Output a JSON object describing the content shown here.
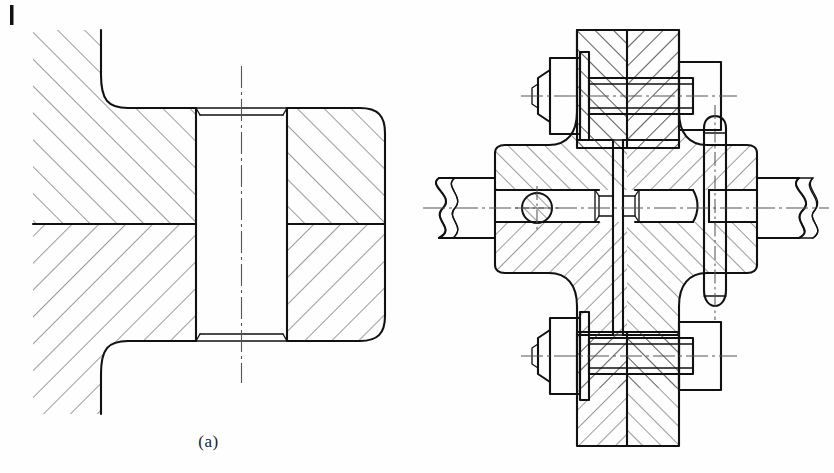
{
  "page": {
    "kind": "engineering-drawing",
    "background_color": "#fefefe",
    "line_color": "#111111",
    "hatch_color": "#3a3a3a",
    "centerline_color": "#555555",
    "width": 834,
    "height": 473,
    "corner_tick": "page-edge-tick"
  },
  "figures": [
    {
      "id": "a",
      "caption": "(a)",
      "title": "Dowel pin in sectioned housing",
      "description": "Sectional view: two hatched bodies joined by a cylindrical dowel pin with chamfered ends; hatching direction reverses across the horizontal parting line.",
      "components": [
        {
          "name": "left-housing-body",
          "type": "sectioned-part",
          "hatch_angle_upper": 45,
          "hatch_angle_lower": -45
        },
        {
          "name": "right-housing-block",
          "type": "sectioned-part",
          "corner": "rounded"
        },
        {
          "name": "dowel-pin",
          "type": "cylindrical-pin",
          "ends": "chamfered"
        },
        {
          "name": "parting-line",
          "type": "horizontal-split"
        },
        {
          "name": "pin-axis",
          "type": "centerline",
          "orientation": "vertical"
        }
      ]
    },
    {
      "id": "b",
      "caption": "(b)",
      "title": "Flange coupling assembly",
      "description": "Sectional assembly of a flanged shaft coupling: two shafts with broken-out ends, two hex-head bolts with washers and nuts, a taper pin, a dowel, and a central gasket flange face.",
      "components": [
        {
          "name": "left-shaft",
          "type": "shaft",
          "end": "broken-out-section"
        },
        {
          "name": "right-shaft",
          "type": "shaft",
          "end": "broken-out-section"
        },
        {
          "name": "left-flange-hub",
          "type": "sectioned-part"
        },
        {
          "name": "right-flange-hub",
          "type": "sectioned-part"
        },
        {
          "name": "upper-bolt",
          "type": "hex-bolt",
          "features": [
            "hex-head",
            "washer",
            "hex-nut",
            "threaded-shank"
          ]
        },
        {
          "name": "lower-bolt",
          "type": "hex-bolt",
          "features": [
            "hex-head",
            "washer",
            "hex-nut",
            "threaded-shank"
          ]
        },
        {
          "name": "taper-pin",
          "type": "taper-pin",
          "orientation": "vertical"
        },
        {
          "name": "dowel-hole",
          "type": "circular-hole",
          "hatched": true
        },
        {
          "name": "central-flange-face",
          "type": "mating-face"
        },
        {
          "name": "shaft-axis",
          "type": "centerline",
          "orientation": "horizontal"
        },
        {
          "name": "upper-bolt-axis",
          "type": "centerline",
          "orientation": "horizontal"
        },
        {
          "name": "lower-bolt-axis",
          "type": "centerline",
          "orientation": "horizontal"
        }
      ]
    }
  ]
}
